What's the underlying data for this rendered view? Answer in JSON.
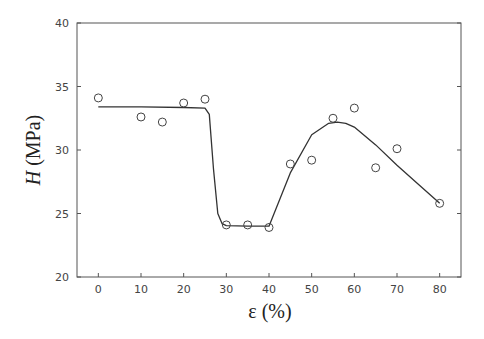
{
  "chart_data": {
    "type": "scatter",
    "title": "",
    "xlabel": "ε (%)",
    "ylabel_italic": "H",
    "ylabel_rest": " (MPa)",
    "ylabel": "H (MPa)",
    "xlim": [
      -5,
      85
    ],
    "ylim": [
      20,
      40
    ],
    "xticks": [
      0,
      10,
      20,
      30,
      40,
      50,
      60,
      70,
      80
    ],
    "yticks": [
      20,
      25,
      30,
      35,
      40
    ],
    "grid": false,
    "legend": null,
    "series": [
      {
        "name": "measured",
        "marker": "open-circle",
        "x": [
          0,
          10,
          15,
          20,
          25,
          30,
          35,
          40,
          45,
          50,
          55,
          60,
          65,
          70,
          80
        ],
        "y": [
          34.1,
          32.6,
          32.2,
          33.7,
          34.0,
          24.1,
          24.1,
          23.9,
          28.9,
          29.2,
          32.5,
          33.3,
          28.6,
          30.1,
          25.8
        ]
      },
      {
        "name": "fit",
        "line": "solid",
        "x": [
          0,
          10,
          20,
          25,
          26,
          27,
          28,
          29,
          30,
          35,
          40,
          45,
          50,
          54,
          56,
          58,
          60,
          65,
          70,
          75,
          80
        ],
        "y": [
          33.4,
          33.4,
          33.35,
          33.3,
          32.8,
          28.5,
          25.0,
          24.2,
          24.05,
          24.0,
          24.0,
          28.2,
          31.2,
          32.1,
          32.2,
          32.1,
          31.8,
          30.4,
          28.8,
          27.3,
          25.8
        ]
      }
    ]
  }
}
